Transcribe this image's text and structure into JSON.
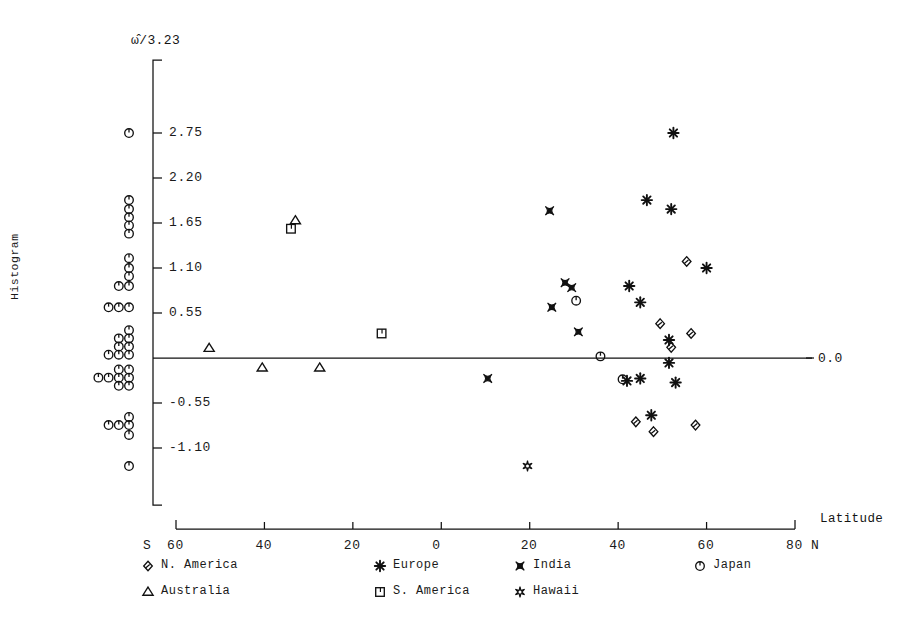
{
  "figure": {
    "ylabel": "Histogram",
    "yaxis_title": "ω̂/3.23",
    "xaxis_title": "Latitude",
    "zero_label": "0.0"
  },
  "chart_data": {
    "type": "scatter",
    "title": "",
    "xlabel": "Latitude",
    "ylabel": "ω̂/3.23",
    "xlim": [
      -65,
      85
    ],
    "ylim": [
      -1.55,
      3.1
    ],
    "grid": false,
    "legend_position": "below-axis",
    "yticks": [
      2.75,
      2.2,
      1.65,
      1.1,
      0.55,
      -0.55,
      -1.1
    ],
    "ytick_labels": [
      "2.75",
      "2.20",
      "1.65",
      "1.10",
      "0.55",
      "-0.55",
      "-1.10"
    ],
    "xticks": [
      -60,
      -40,
      -20,
      0,
      20,
      40,
      60,
      80
    ],
    "xtick_labels": [
      "60",
      "40",
      "20",
      "0",
      "20",
      "40",
      "60",
      "80"
    ],
    "x_axis_prefix": "S",
    "x_axis_suffix": "N",
    "zero_line": 0.0,
    "legend": [
      {
        "key": "n_america",
        "label": "N. America",
        "marker": "diamond-arrow"
      },
      {
        "key": "europe",
        "label": "Europe",
        "marker": "asterisk"
      },
      {
        "key": "india",
        "label": "India",
        "marker": "bowtie"
      },
      {
        "key": "japan",
        "label": "Japan",
        "marker": "circle-tick"
      },
      {
        "key": "australia",
        "label": "Australia",
        "marker": "triangle"
      },
      {
        "key": "s_america",
        "label": "S. America",
        "marker": "square-bracket"
      },
      {
        "key": "hawaii",
        "label": "Hawaii",
        "marker": "star-circle"
      }
    ],
    "series": [
      {
        "name": "N. America",
        "key": "n_america",
        "marker": "diamond-arrow",
        "points": [
          {
            "x": 55.5,
            "y": 1.18
          },
          {
            "x": 49.5,
            "y": 0.42
          },
          {
            "x": 56.5,
            "y": 0.3
          },
          {
            "x": 44.0,
            "y": -0.78
          },
          {
            "x": 48.0,
            "y": -0.9
          },
          {
            "x": 57.5,
            "y": -0.82
          },
          {
            "x": 52.0,
            "y": 0.13
          }
        ]
      },
      {
        "name": "Europe",
        "key": "europe",
        "marker": "asterisk",
        "points": [
          {
            "x": 52.5,
            "y": 2.75
          },
          {
            "x": 46.5,
            "y": 1.93
          },
          {
            "x": 52.0,
            "y": 1.82
          },
          {
            "x": 60.0,
            "y": 1.1
          },
          {
            "x": 42.5,
            "y": 0.88
          },
          {
            "x": 45.0,
            "y": 0.68
          },
          {
            "x": 51.5,
            "y": 0.22
          },
          {
            "x": 51.5,
            "y": -0.06
          },
          {
            "x": 42.0,
            "y": -0.28
          },
          {
            "x": 45.0,
            "y": -0.25
          },
          {
            "x": 53.0,
            "y": -0.3
          },
          {
            "x": 47.5,
            "y": -0.7
          }
        ]
      },
      {
        "name": "India",
        "key": "india",
        "marker": "bowtie",
        "points": [
          {
            "x": 24.5,
            "y": 1.8
          },
          {
            "x": 28.0,
            "y": 0.92
          },
          {
            "x": 29.5,
            "y": 0.86
          },
          {
            "x": 25.0,
            "y": 0.62
          },
          {
            "x": 31.0,
            "y": 0.32
          },
          {
            "x": 10.5,
            "y": -0.25
          }
        ]
      },
      {
        "name": "Japan",
        "key": "japan",
        "marker": "circle-tick",
        "points": [
          {
            "x": 30.5,
            "y": 0.7
          },
          {
            "x": 36.0,
            "y": 0.02
          },
          {
            "x": 41.0,
            "y": -0.26
          }
        ]
      },
      {
        "name": "Australia",
        "key": "australia",
        "marker": "triangle",
        "points": [
          {
            "x": -33.0,
            "y": 1.68
          },
          {
            "x": -52.5,
            "y": 0.12
          },
          {
            "x": -40.5,
            "y": -0.12
          },
          {
            "x": -27.5,
            "y": -0.12
          }
        ]
      },
      {
        "name": "S. America",
        "key": "s_america",
        "marker": "square-bracket",
        "points": [
          {
            "x": -34.0,
            "y": 1.58
          },
          {
            "x": -13.5,
            "y": 0.3
          }
        ]
      },
      {
        "name": "Hawaii",
        "key": "hawaii",
        "marker": "star-circle",
        "points": [
          {
            "x": 19.5,
            "y": -1.32
          }
        ]
      }
    ],
    "histogram": {
      "description": "Stacked Japan-style circle markers forming a horizontal histogram along the left of the y-axis; each circle is one count.",
      "marker": "circle-tick",
      "bins": [
        {
          "y": 2.75,
          "count": 1
        },
        {
          "y": 1.93,
          "count": 1
        },
        {
          "y": 1.82,
          "count": 1
        },
        {
          "y": 1.72,
          "count": 1
        },
        {
          "y": 1.62,
          "count": 1
        },
        {
          "y": 1.52,
          "count": 1
        },
        {
          "y": 1.22,
          "count": 1
        },
        {
          "y": 1.1,
          "count": 1
        },
        {
          "y": 1.0,
          "count": 1
        },
        {
          "y": 0.88,
          "count": 2
        },
        {
          "y": 0.62,
          "count": 3
        },
        {
          "y": 0.34,
          "count": 1
        },
        {
          "y": 0.24,
          "count": 2
        },
        {
          "y": 0.14,
          "count": 2
        },
        {
          "y": 0.04,
          "count": 3
        },
        {
          "y": -0.14,
          "count": 2
        },
        {
          "y": -0.24,
          "count": 4
        },
        {
          "y": -0.34,
          "count": 2
        },
        {
          "y": -0.72,
          "count": 1
        },
        {
          "y": -0.82,
          "count": 3
        },
        {
          "y": -0.94,
          "count": 1
        },
        {
          "y": -1.32,
          "count": 1
        }
      ]
    }
  }
}
